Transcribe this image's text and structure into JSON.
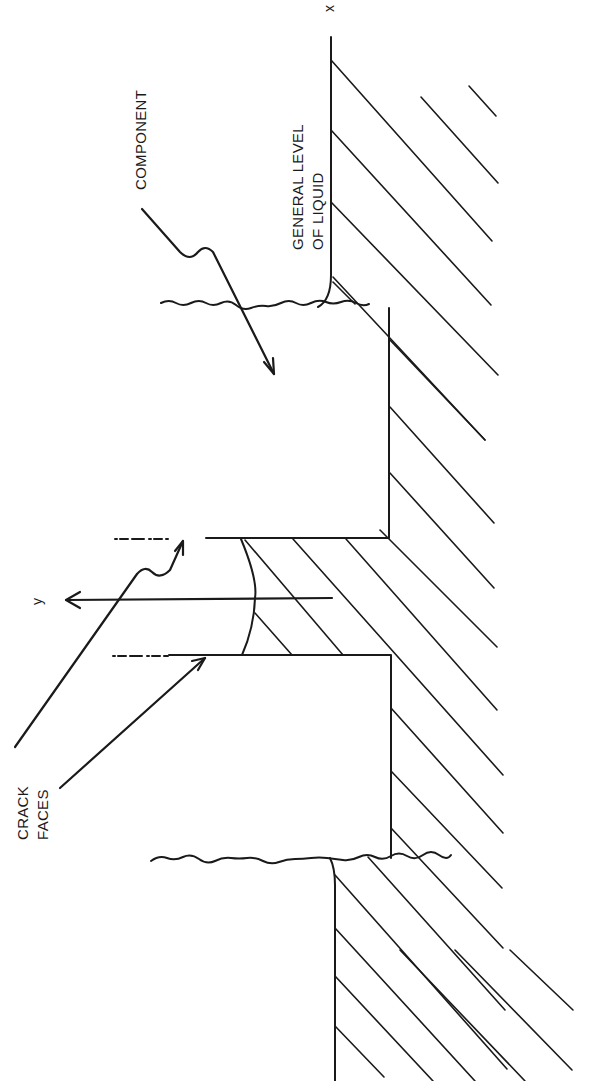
{
  "figure": {
    "orientation": "rotated-90-ccw",
    "labels": {
      "component": "COMPONENT",
      "liquid_line1": "GENERAL LEVEL",
      "liquid_line2": "OF LIQUID",
      "crack_line1": "CRACK",
      "crack_line2": "FACES",
      "axis_x": "x",
      "axis_y": "y"
    },
    "elements": [
      "component-block-upper",
      "component-block-lower",
      "crack-gap",
      "liquid-meniscus-in-crack",
      "liquid-hatched-region",
      "y-axis-arrow",
      "crack-face-pointers",
      "component-pointer"
    ],
    "colors": {
      "ink": "#1a1a1a",
      "background": "#ffffff"
    }
  }
}
